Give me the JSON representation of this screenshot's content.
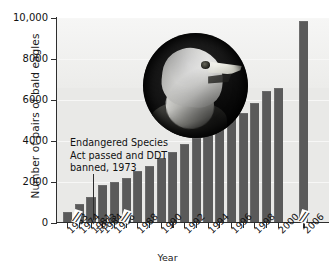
{
  "chart_data": {
    "type": "bar",
    "title": "",
    "xlabel": "Year",
    "ylabel": "Number of pairs of bald eagles",
    "ylim": [
      0,
      10000
    ],
    "yticks": [
      0,
      2000,
      4000,
      6000,
      8000,
      10000
    ],
    "ytick_labels": [
      "0",
      "2000",
      "4000",
      "6000",
      "8000",
      "10,000"
    ],
    "grid": true,
    "legend": "none",
    "bar_color": "#5a5a5a",
    "plot_background": "#e9e9e7",
    "categories": [
      "1963",
      "1974",
      "1981",
      "1984",
      "1986",
      "1988",
      "1990",
      "1992",
      "1994",
      "1996",
      "1998",
      "2000",
      "2006"
    ],
    "values": [
      500,
      900,
      1200,
      1800,
      1950,
      2150,
      3100,
      4100,
      4500,
      5200,
      5800,
      6550,
      9800
    ],
    "tick_labels": [
      "1963",
      "1973",
      "1974",
      "1981",
      "1984",
      "1986",
      "1988",
      "1990",
      "1992",
      "1994",
      "1996",
      "1998",
      "2000",
      "2006"
    ],
    "axis_breaks": [
      "after-1963",
      "after-1974",
      "before-2006"
    ],
    "axis_break_symbol": "//",
    "annotation": "Endangered Species\nAct passed and DDT\nbanned, 1973",
    "annotation_year": "1973",
    "bars": [
      {
        "year": "1963",
        "value": 500
      },
      {
        "year": "1974",
        "value": 900
      },
      {
        "year": "1981",
        "value": 1200
      },
      {
        "year": "1984",
        "value": 1800
      },
      {
        "year": "1986",
        "value": 1950
      },
      {
        "year": "1987",
        "value": 2150
      },
      {
        "year": "1988",
        "value": 2500
      },
      {
        "year": "1989",
        "value": 2750
      },
      {
        "year": "1990",
        "value": 3100
      },
      {
        "year": "1991",
        "value": 3400
      },
      {
        "year": "1992",
        "value": 3800
      },
      {
        "year": "1993",
        "value": 4100
      },
      {
        "year": "1994",
        "value": 4500
      },
      {
        "year": "1995",
        "value": 4800
      },
      {
        "year": "1996",
        "value": 5200
      },
      {
        "year": "1997",
        "value": 5300
      },
      {
        "year": "1998",
        "value": 5800
      },
      {
        "year": "1999",
        "value": 6400
      },
      {
        "year": "2000",
        "value": 6550
      },
      {
        "year": "2006",
        "value": 9800
      }
    ]
  },
  "figure": {
    "photo_caption": "bald-eagle-photo"
  }
}
